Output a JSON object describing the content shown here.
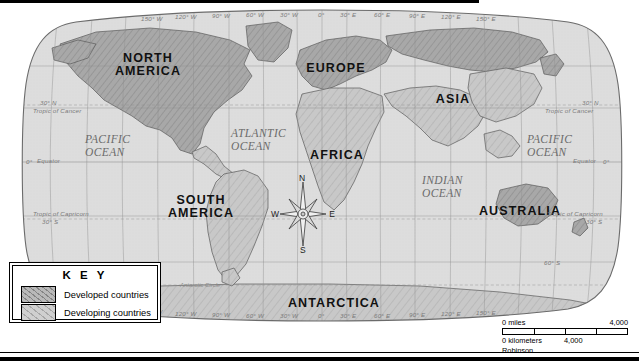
{
  "map": {
    "projection_label": "Robinson",
    "continents": [
      {
        "name": "north-america",
        "lines": [
          "NORTH",
          "AMERICA"
        ],
        "x": 140,
        "y": 54
      },
      {
        "name": "south-america",
        "lines": [
          "SOUTH",
          "AMERICA"
        ],
        "x": 192,
        "y": 196
      },
      {
        "name": "europe",
        "lines": [
          "EUROPE"
        ],
        "x": 333,
        "y": 64
      },
      {
        "name": "africa",
        "lines": [
          "AFRICA"
        ],
        "x": 336,
        "y": 151
      },
      {
        "name": "asia",
        "lines": [
          "ASIA"
        ],
        "x": 453,
        "y": 95
      },
      {
        "name": "australia",
        "lines": [
          "AUSTRALIA"
        ],
        "x": 519,
        "y": 207
      },
      {
        "name": "antarctica",
        "lines": [
          "ANTARCTICA"
        ],
        "x": 333,
        "y": 299
      }
    ],
    "oceans": [
      {
        "name": "pacific-ocean-west",
        "lines": [
          "PACIFIC",
          "OCEAN"
        ],
        "x": 113,
        "y": 140
      },
      {
        "name": "atlantic-ocean",
        "lines": [
          "ATLANTIC",
          "OCEAN"
        ],
        "x": 258,
        "y": 134
      },
      {
        "name": "indian-ocean",
        "lines": [
          "INDIAN",
          "OCEAN"
        ],
        "x": 455,
        "y": 180
      },
      {
        "name": "pacific-ocean-east",
        "lines": [
          "PACIFIC",
          "OCEAN"
        ],
        "x": 549,
        "y": 140
      }
    ],
    "longitude_labels_top": [
      {
        "label": "150° W",
        "x": 151
      },
      {
        "label": "120° W",
        "x": 185
      },
      {
        "label": "90° W",
        "x": 220
      },
      {
        "label": "60° W",
        "x": 254
      },
      {
        "label": "30° W",
        "x": 289
      },
      {
        "label": "0°",
        "x": 322
      },
      {
        "label": "30° E",
        "x": 352
      },
      {
        "label": "60° E",
        "x": 387
      },
      {
        "label": "90° E",
        "x": 421
      },
      {
        "label": "120° E",
        "x": 455
      },
      {
        "label": "150° E",
        "x": 489
      }
    ],
    "longitude_labels_bottom": [
      {
        "label": "150° W",
        "x": 151
      },
      {
        "label": "120° W",
        "x": 185
      },
      {
        "label": "90° W",
        "x": 220
      },
      {
        "label": "60° W",
        "x": 254
      },
      {
        "label": "30° W",
        "x": 289
      },
      {
        "label": "0°",
        "x": 322
      },
      {
        "label": "30° E",
        "x": 352
      },
      {
        "label": "60° E",
        "x": 387
      },
      {
        "label": "90° E",
        "x": 421
      },
      {
        "label": "120° E",
        "x": 455
      },
      {
        "label": "150° E",
        "x": 489
      }
    ],
    "latitude_labels_left": [
      {
        "label": "30° N",
        "y": 98,
        "x": 40
      },
      {
        "label": "Tropic of Cancer",
        "y": 106,
        "x": 36
      },
      {
        "label": "0°",
        "y": 158,
        "x": 29
      },
      {
        "label": "Equator",
        "y": 157,
        "x": 40
      },
      {
        "label": "Tropic of Capricorn",
        "y": 209,
        "x": 36
      },
      {
        "label": "30° S",
        "y": 217,
        "x": 44
      }
    ],
    "latitude_labels_right": [
      {
        "label": "30° N",
        "y": 98,
        "x": 585
      },
      {
        "label": "Tropic of Cancer",
        "y": 106,
        "x": 547
      },
      {
        "label": "Equator",
        "y": 157,
        "x": 575
      },
      {
        "label": "0°",
        "y": 158,
        "x": 606
      },
      {
        "label": "Tropic of Capricorn",
        "y": 209,
        "x": 549
      },
      {
        "label": "30° S",
        "y": 217,
        "x": 588
      },
      {
        "label": "60° S",
        "y": 258,
        "x": 546
      }
    ],
    "circle_labels": [
      {
        "label": "Antarctic Circle",
        "x": 185,
        "y": 283
      }
    ],
    "compass": {
      "north": "N",
      "south": "S",
      "east": "E",
      "west": "W",
      "x": 273,
      "y": 174
    }
  },
  "key": {
    "title": "K E Y",
    "items": [
      {
        "label": "Developed countries",
        "swatch": "developed",
        "color": "#b9b9b9"
      },
      {
        "label": "Developing countries",
        "swatch": "developing",
        "color": "#cfcfcf"
      }
    ]
  },
  "scale": {
    "miles_label": "0 miles",
    "miles_value": "4,000",
    "km_label": "0 kilometers",
    "km_value": "4,000",
    "projection": "Robinson"
  },
  "colors": {
    "land_developed": "#a9a9a9",
    "land_developing": "#c6c6c6",
    "ocean": "#dcdcdc",
    "graticule": "#9a9a9a",
    "outline": "#5a5a5a",
    "frame": "#000000"
  }
}
